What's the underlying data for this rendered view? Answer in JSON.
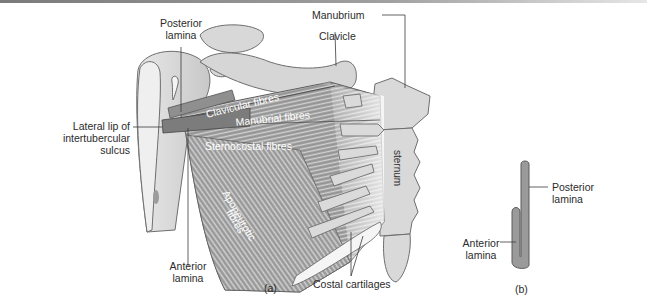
{
  "figure": {
    "panels": [
      {
        "id": "a",
        "caption": "(a)"
      },
      {
        "id": "b",
        "caption": "(b)"
      }
    ],
    "panel_a": {
      "labels": {
        "posterior_lamina": [
          "Posterior",
          "lamina"
        ],
        "lateral_lip": [
          "Lateral lip of",
          "intertubercular",
          "sulcus"
        ],
        "anterior_lamina": [
          "Anterior",
          "lamina"
        ],
        "manubrium": "Manubrium",
        "clavicle": "Clavicle",
        "costal_cartilages": "Costal cartilages",
        "sternum": "sternum"
      },
      "muscle_parts": {
        "clavicular": "Clavicular fibres",
        "manubrial": "Manubrial fibres",
        "sternocostal": "Sternocostal fibres",
        "aponeurotic": [
          "Aponeurotic",
          "fibres"
        ]
      }
    },
    "panel_b": {
      "labels": {
        "posterior_lamina": [
          "Posterior",
          "lamina"
        ],
        "anterior_lamina": [
          "Anterior",
          "lamina"
        ]
      }
    },
    "colors": {
      "bone": "#dcdcdc",
      "bone_stroke": "#6e6e6e",
      "muscle": "#9a9a9a",
      "muscle_dark": "#6f6f6f",
      "text": "#2b2b2b"
    }
  }
}
